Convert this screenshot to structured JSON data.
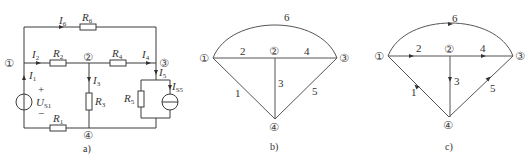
{
  "figure_a": {
    "caption": "a)",
    "nodes": [
      "①",
      "②",
      "③",
      "④"
    ],
    "resistors": {
      "R1": {
        "main": "R",
        "sub": "1"
      },
      "R2": {
        "main": "R",
        "sub": "2"
      },
      "R3": {
        "main": "R",
        "sub": "3"
      },
      "R4": {
        "main": "R",
        "sub": "4"
      },
      "R5": {
        "main": "R",
        "sub": "5"
      },
      "R6": {
        "main": "R",
        "sub": "6"
      }
    },
    "currents": {
      "I1": {
        "main": "I",
        "sub": "1"
      },
      "I2": {
        "main": "I",
        "sub": "2"
      },
      "I3": {
        "main": "I",
        "sub": "3"
      },
      "I4": {
        "main": "I",
        "sub": "4"
      },
      "I5": {
        "main": "I",
        "sub": "5"
      },
      "I6": {
        "main": "I",
        "sub": "6"
      },
      "IS5": {
        "main": "I",
        "sub": "S5"
      }
    },
    "voltage_source": {
      "main": "U",
      "sub": "S1",
      "plus": "+",
      "minus": "−"
    }
  },
  "figure_b": {
    "caption": "b)",
    "nodes": [
      "①",
      "②",
      "③",
      "④"
    ],
    "branches": [
      "1",
      "2",
      "3",
      "4",
      "5",
      "6"
    ]
  },
  "figure_c": {
    "caption": "c)",
    "nodes": [
      "①",
      "②",
      "③",
      "④"
    ],
    "branches": [
      "1",
      "2",
      "3",
      "4",
      "5",
      "6"
    ]
  },
  "colors": {
    "line": "#3a3a3a",
    "text": "#333333",
    "background": "#ffffff"
  }
}
